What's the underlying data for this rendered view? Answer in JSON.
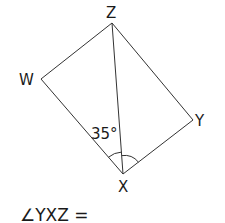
{
  "diagram": {
    "type": "geometry",
    "shape": "rectangle",
    "vertices": {
      "Z": {
        "label": "Z",
        "x": 112,
        "y": 23
      },
      "W": {
        "label": "W",
        "x": 41,
        "y": 79
      },
      "Y": {
        "label": "Y",
        "x": 193,
        "y": 120
      },
      "X": {
        "label": "X",
        "x": 123,
        "y": 174
      }
    },
    "diagonal": "XZ",
    "given_angle": {
      "angle": "WXZ",
      "value_label": "35°"
    },
    "marked_angles": [
      "WXZ",
      "YXZ"
    ]
  },
  "question": {
    "text": "∠YXZ ="
  },
  "colors": {
    "line": "#333333",
    "text": "#1a1a1a",
    "background": "#ffffff"
  }
}
